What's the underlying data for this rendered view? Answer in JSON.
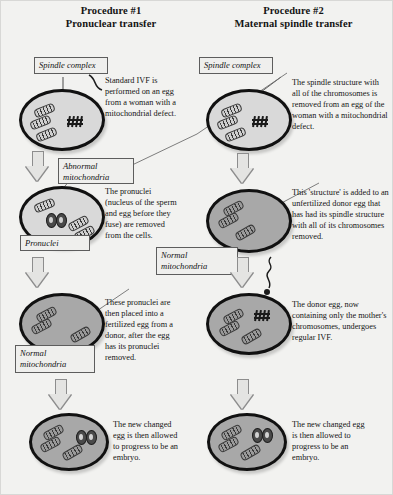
{
  "diagram": {
    "background_color": "#f2f2f0",
    "columns": [
      {
        "title_line1": "Procedure #1",
        "title_line2": "Pronuclear transfer",
        "steps": [
          {
            "cell_shade": "light",
            "callout_label": "Spindle complex",
            "description": "Standard IVF is performed on an egg from a woman with a mitochondrial defect.",
            "has_chromosomes": true,
            "has_pronuclei": false,
            "has_sperm": false
          },
          {
            "cell_shade": "light",
            "callout_label": "Abnormal mitochondria",
            "callout_label_2": "Pronuclei",
            "description": "The pronuclei (nucleus of the sperm and egg before they fuse) are removed from the cells.",
            "has_chromosomes": false,
            "has_pronuclei": true,
            "has_sperm": false
          },
          {
            "cell_shade": "dark",
            "callout_label": "Normal mitochondria",
            "description": "These pronuclei are then placed into a fertilized egg from a donor, after the egg has its pronuclei removed.",
            "has_chromosomes": false,
            "has_pronuclei": false,
            "has_sperm": false
          },
          {
            "cell_shade": "dark",
            "description": "The new changed egg is then allowed to progress to be an embryo.",
            "has_chromosomes": false,
            "has_pronuclei": true,
            "has_sperm": false
          }
        ]
      },
      {
        "title_line1": "Procedure #2",
        "title_line2": "Maternal spindle transfer",
        "steps": [
          {
            "cell_shade": "light",
            "callout_label": "Spindle complex",
            "description": "The spindle structure with all of the chromosomes is removed from an egg of the woman with a mitochondrial defect.",
            "has_chromosomes": true,
            "has_pronuclei": false,
            "has_sperm": false
          },
          {
            "cell_shade": "dark",
            "callout_label": "Normal mitochondria",
            "description": "This 'structure' is added to an unfertilized donor egg that has had its spindle structure with all of its chromosomes removed.",
            "has_chromosomes": false,
            "has_pronuclei": false,
            "has_sperm": false
          },
          {
            "cell_shade": "dark",
            "description": "The donor egg, now containing only the mother's chromosomes, undergoes regular IVF.",
            "has_chromosomes": true,
            "has_pronuclei": false,
            "has_sperm": true
          },
          {
            "cell_shade": "dark",
            "description": "The new changed egg is then allowed to progress to be an embryo.",
            "has_chromosomes": false,
            "has_pronuclei": true,
            "has_sperm": false
          }
        ]
      }
    ]
  }
}
